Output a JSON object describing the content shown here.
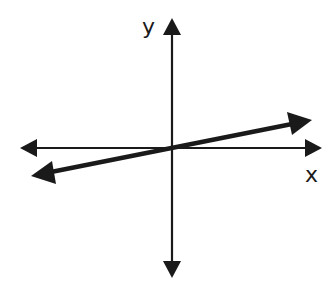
{
  "diagram": {
    "type": "coordinate-plane-line",
    "axes": {
      "x_label": "x",
      "y_label": "y",
      "origin": [
        172,
        148
      ],
      "x_axis": {
        "from": [
          20,
          148
        ],
        "to": [
          322,
          148
        ],
        "arrows": "both"
      },
      "y_axis": {
        "from": [
          172,
          18
        ],
        "to": [
          172,
          278
        ],
        "arrows": "both"
      }
    },
    "line": {
      "description": "line with small positive slope passing through the origin",
      "from": [
        31,
        176
      ],
      "to": [
        312,
        120
      ],
      "arrows": "both",
      "slope_sign": "positive",
      "passes_through_origin": true
    },
    "colors": {
      "stroke": "#1a1a1a",
      "background": "#ffffff"
    }
  }
}
